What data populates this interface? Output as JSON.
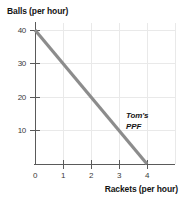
{
  "chart_data": {
    "type": "line",
    "title": "",
    "xlabel": "Rackets (per hour)",
    "ylabel": "Balls (per hour)",
    "xlim": [
      0,
      4.3
    ],
    "ylim": [
      0,
      43
    ],
    "xticks": [
      "0",
      "1",
      "2",
      "3",
      "4"
    ],
    "xtick_values": [
      0,
      1,
      2,
      3,
      4
    ],
    "yticks": [
      "10",
      "20",
      "30",
      "40"
    ],
    "ytick_values": [
      10,
      20,
      30,
      40
    ],
    "grid": true,
    "legend_position": "inline-annotation",
    "series": [
      {
        "name": "Tom's PPF",
        "annotation_lines": [
          "Tom's",
          "PPF"
        ],
        "color": "#8c8c8c",
        "x": [
          0,
          4
        ],
        "values": [
          40,
          0
        ],
        "points": [
          [
            0,
            40
          ],
          [
            4,
            0
          ]
        ]
      }
    ]
  },
  "axes": {
    "y_title": "Balls (per hour)",
    "x_title": "Rackets (per hour)"
  },
  "annotation": {
    "line1": "Tom's",
    "line2": "PPF"
  },
  "colors": {
    "ppf_line": "#8c8c8c",
    "axis": "#5a5a5a",
    "grid": "#e9e9e9",
    "text": "#141414"
  }
}
